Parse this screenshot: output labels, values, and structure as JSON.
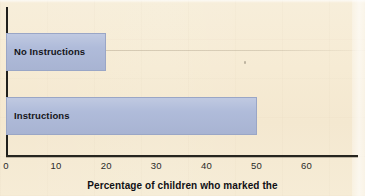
{
  "chart_data": {
    "type": "bar",
    "orientation": "horizontal",
    "title": "",
    "xlabel": "Percentage of children who marked the",
    "ylabel": "",
    "categories": [
      "No Instructions",
      "Instructions"
    ],
    "values": [
      20,
      50
    ],
    "xlim": [
      0,
      70
    ],
    "xticks": [
      0,
      10,
      20,
      30,
      40,
      50,
      60
    ],
    "xtick_labels": [
      "0",
      "10",
      "20",
      "30",
      "40",
      "50",
      "60"
    ],
    "grid": false,
    "legend": null,
    "bar_color": "#aebad9",
    "background_color": "#f5e9d3",
    "axis_color": "#20201d",
    "bars": [
      {
        "label": "No Instructions",
        "value": 20
      },
      {
        "label": "Instructions",
        "value": 50
      }
    ]
  },
  "axis": {
    "caption": "Percentage of children who marked the"
  }
}
